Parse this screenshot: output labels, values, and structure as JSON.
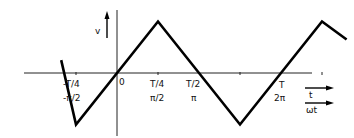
{
  "diagram": {
    "waveform_type": "triangle",
    "axes": {
      "y_label": "v",
      "x_label_time": "t",
      "x_label_phase": "ωt"
    },
    "tick_labels": [
      {
        "time": "-T/4",
        "phase": "-π/2"
      },
      {
        "time": "0",
        "phase": ""
      },
      {
        "time": "T/4",
        "phase": "π/2"
      },
      {
        "time": "T/2",
        "phase": "π"
      },
      {
        "time": "T",
        "phase": "2π"
      }
    ],
    "waveform_points_in_periods": [
      [
        -0.34,
        0.25
      ],
      [
        -0.25,
        -1
      ],
      [
        0.25,
        1
      ],
      [
        0.75,
        -1
      ],
      [
        1.25,
        1
      ],
      [
        1.4,
        0.65
      ]
    ]
  }
}
